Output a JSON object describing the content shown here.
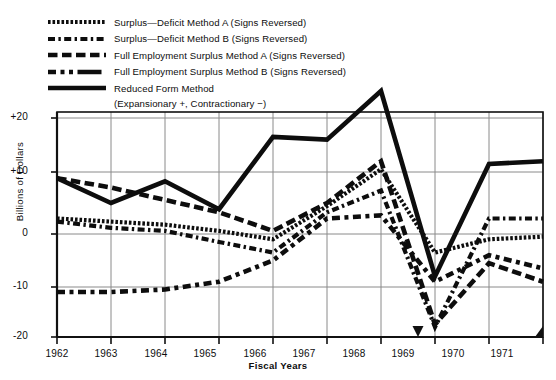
{
  "chart_data": {
    "type": "line",
    "title": "",
    "xlabel": "Fiscal Years",
    "ylabel": "Billions of Dollars",
    "x": [
      1962,
      1963,
      1964,
      1965,
      1966,
      1967,
      1968,
      1969,
      1970,
      1971
    ],
    "xtick_labels": [
      "1962",
      "1963",
      "1964",
      "1965",
      "1966",
      "1967",
      "1968",
      "1969",
      "1970",
      "1971"
    ],
    "ytick_labels": [
      "+20",
      "+10",
      "0",
      "-10",
      "-20"
    ],
    "ytick_values": [
      20,
      10,
      0,
      -10,
      -20
    ],
    "ylim": [
      -20,
      20
    ],
    "xlim": [
      1962,
      1971
    ],
    "grid": true,
    "legend_position": "top-left",
    "annotation": "(Expansionary +, Contractionary −)",
    "series": [
      {
        "name": "Surplus—Deficit Method A (Signs Reversed)",
        "style": "dotted",
        "values": [
          2.5,
          2.0,
          1.5,
          0.5,
          -1.0,
          4.5,
          10.5,
          -3.5,
          -1.0,
          -0.5
        ]
      },
      {
        "name": "Surplus—Deficit Method B (Signs Reversed)",
        "style": "dashdot",
        "values": [
          2.0,
          1.0,
          0.5,
          -1.5,
          -3.5,
          3.5,
          7.0,
          -18.0,
          2.5,
          2.5
        ]
      },
      {
        "name": "Full Employment Surplus Method A (Signs Reversed)",
        "style": "longdash",
        "values": [
          9.0,
          7.5,
          5.5,
          3.5,
          0.5,
          5.0,
          12.0,
          -17.5,
          -5.5,
          -9.0
        ]
      },
      {
        "name": "Full Employment Surplus Method B (Signs Reversed)",
        "style": "dashdashlong",
        "values": [
          -11.0,
          -11.0,
          -10.5,
          -9.0,
          -5.0,
          2.5,
          3.0,
          -9.0,
          -4.0,
          -6.5
        ]
      },
      {
        "name": "Reduced Form Method",
        "style": "solid",
        "values": [
          9.0,
          5.0,
          8.5,
          4.0,
          16.5,
          16.0,
          25.0,
          -8.0,
          11.5,
          12.0
        ]
      }
    ]
  },
  "legend": {
    "items": [
      {
        "label": "Surplus—Deficit Method A (Signs Reversed)"
      },
      {
        "label": "Surplus—Deficit Method B (Signs Reversed)"
      },
      {
        "label": "Full Employment Surplus Method A (Signs Reversed)"
      },
      {
        "label": "Full Employment Surplus Method B (Signs Reversed)"
      },
      {
        "label": "Reduced Form Method"
      }
    ],
    "sublabel": "(Expansionary +, Contractionary −)"
  },
  "axes": {
    "y_title": "Billions of Dollars",
    "x_title": "Fiscal Years",
    "y_ticks": [
      "+20",
      "+10",
      "0",
      "-10",
      "-20"
    ],
    "x_ticks": [
      "1962",
      "1963",
      "1964",
      "1965",
      "1966",
      "1967",
      "1968",
      "1969",
      "1970",
      "1971"
    ]
  },
  "colors": {
    "ink": "#0d0d0d",
    "grid": "#8a8a8a",
    "background": "#ffffff"
  }
}
